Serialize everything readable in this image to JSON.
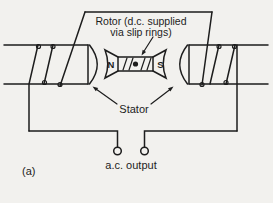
{
  "diagram": {
    "title_line1": "Rotor (d.c. supplied",
    "title_line2": "via slip rings)",
    "stator_label": "Stator",
    "output_label": "a.c. output",
    "panel_label": "(a)",
    "rotor_poles": {
      "north": "N",
      "south": "S"
    },
    "colors": {
      "background": "#f2f1ee",
      "line": "#1d1d1d"
    }
  }
}
